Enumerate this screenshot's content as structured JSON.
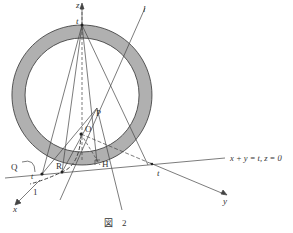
{
  "figure": {
    "caption": "図　2",
    "labels": {
      "z_axis": "z",
      "x_axis": "x",
      "y_axis": "y",
      "t_top": "t",
      "t_bottom": "t",
      "t_left": "t",
      "l_line": "l",
      "P": "P",
      "O": "O",
      "H": "H",
      "R": "R",
      "Q": "Q",
      "one": "1",
      "line_eq": "x + y = t,  z = 0"
    },
    "colors": {
      "ring_fill": "#b0b0b0",
      "stroke": "#333333",
      "background": "#ffffff"
    }
  }
}
